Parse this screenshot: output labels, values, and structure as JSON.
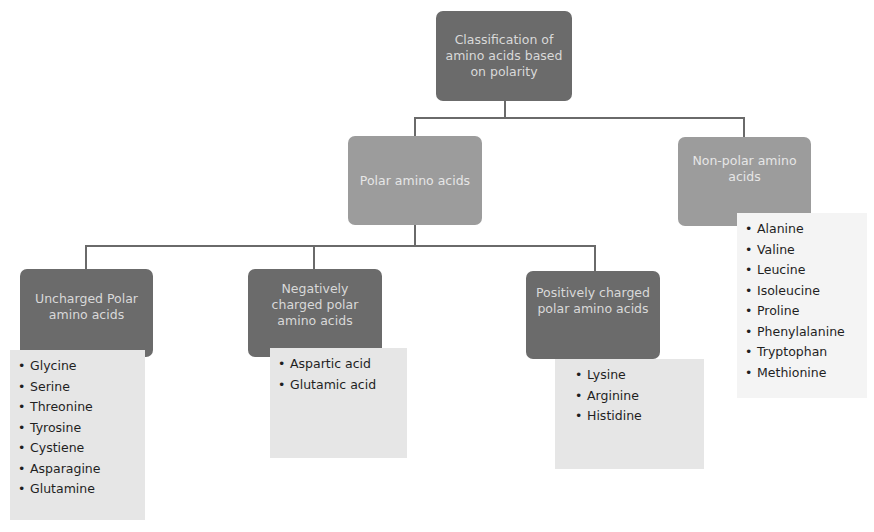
{
  "root": {
    "label": "Classification of amino acids based on polarity"
  },
  "polar": {
    "label": "Polar amino acids"
  },
  "nonpolar": {
    "label": "Non-polar amino acids",
    "items": [
      "Alanine",
      "Valine",
      "Leucine",
      "Isoleucine",
      "Proline",
      "Phenylalanine",
      "Tryptophan",
      "Methionine"
    ]
  },
  "uncharged": {
    "label": "Uncharged Polar amino acids",
    "items": [
      "Glycine",
      "Serine",
      "Threonine",
      "Tyrosine",
      "Cystiene",
      "Asparagine",
      "Glutamine"
    ]
  },
  "negative": {
    "label": "Negatively charged polar amino acids",
    "items": [
      "Aspartic acid",
      "Glutamic acid"
    ]
  },
  "positive": {
    "label": "Positively charged polar amino acids",
    "items": [
      "Lysine",
      "Arginine",
      "Histidine"
    ]
  },
  "colors": {
    "dark_node": "#6b6b6b",
    "mid_node": "#9c9c9c",
    "list_bg": "#e6e6e6",
    "connector": "#6a6a6a"
  }
}
